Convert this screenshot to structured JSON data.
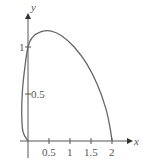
{
  "chart_data": {
    "type": "line",
    "title": "",
    "xlabel": "x",
    "ylabel": "y",
    "xlim": [
      -0.15,
      2.2
    ],
    "ylim": [
      0,
      1.3
    ],
    "x_ticks": [
      "0.5",
      "1",
      "1.5",
      "2"
    ],
    "y_ticks": [
      "0.5",
      "1"
    ],
    "grid": false,
    "series": [
      {
        "name": "closed curve",
        "color": "#666666",
        "points": [
          [
            0,
            0
          ],
          [
            -0.12,
            0.1
          ],
          [
            -0.15,
            0.3
          ],
          [
            -0.13,
            0.55
          ],
          [
            -0.07,
            0.8
          ],
          [
            0,
            1
          ],
          [
            0.1,
            1.1
          ],
          [
            0.3,
            1.16
          ],
          [
            0.55,
            1.17
          ],
          [
            0.8,
            1.12
          ],
          [
            1.1,
            1.0
          ],
          [
            1.4,
            0.82
          ],
          [
            1.65,
            0.6
          ],
          [
            1.85,
            0.35
          ],
          [
            1.95,
            0.15
          ],
          [
            2,
            0
          ]
        ]
      }
    ]
  },
  "labels": {
    "x": "x",
    "y": "y",
    "xt": [
      "0.5",
      "1",
      "1.5",
      "2"
    ],
    "yt1": "1",
    "yt05": "0.5"
  }
}
